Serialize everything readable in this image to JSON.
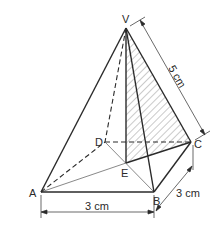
{
  "diagram": {
    "type": "square-based pyramid",
    "points": {
      "V": {
        "label": "V",
        "x": 126,
        "y": 28
      },
      "A": {
        "label": "A",
        "x": 41,
        "y": 192
      },
      "B": {
        "label": "B",
        "x": 154,
        "y": 192
      },
      "C": {
        "label": "C",
        "x": 191,
        "y": 142
      },
      "D": {
        "label": "D",
        "x": 105,
        "y": 142
      },
      "E": {
        "label": "E",
        "x": 126,
        "y": 163
      }
    },
    "dimensions": {
      "ab": "3 cm",
      "bc": "3 cm",
      "vc": "5 cm"
    },
    "shaded_region": "triangle VEC",
    "colors": {
      "line": "#2a2a2a",
      "hatch": "#555555",
      "background": "#ffffff"
    }
  }
}
